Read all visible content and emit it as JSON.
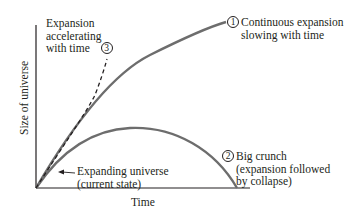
{
  "diagram": {
    "title": "",
    "axes": {
      "x_label": "Time",
      "y_label": "Size of universe"
    },
    "curves": [
      {
        "id": 1,
        "label_lines": [
          "Continuous expansion",
          "slowing with time"
        ],
        "style": "solid",
        "color": "#6d6d6d"
      },
      {
        "id": 2,
        "label_lines": [
          "Big crunch",
          "(expansion followed",
          "by collapse)"
        ],
        "style": "solid",
        "color": "#6d6d6d"
      },
      {
        "id": 3,
        "label_lines": [
          "Expansion",
          "accelerating",
          "with time"
        ],
        "style": "dashed",
        "color": "#231f20"
      }
    ],
    "annotation": {
      "label_lines": [
        "Expanding universe",
        "(current state)"
      ]
    },
    "numbers": {
      "c1": "1",
      "c2": "2",
      "c3": "3"
    }
  }
}
